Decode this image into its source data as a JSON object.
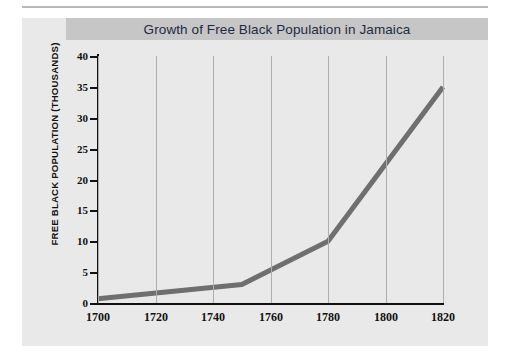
{
  "figure": {
    "title": "Growth of Free Black Population in Jamaica",
    "panel_bg": "#e9e9e9",
    "title_band_bg": "#c6c6c6",
    "title_color": "#1d2b44"
  },
  "chart_data": {
    "type": "line",
    "title": "Growth of Free Black Population in Jamaica",
    "xlabel": "",
    "ylabel": "FREE BLACK POPULATION (THOUSANDS)",
    "xlim": [
      1700,
      1820
    ],
    "ylim": [
      0,
      40
    ],
    "grid": "vertical",
    "legend": "none",
    "line_color": "#6f6f6f",
    "line_width_px": 5,
    "x_ticks": [
      1700,
      1720,
      1740,
      1760,
      1780,
      1800,
      1820
    ],
    "x_tick_labels": [
      "1700",
      "1720",
      "1740",
      "1760",
      "1780",
      "1800",
      "1820"
    ],
    "y_ticks": [
      0,
      5,
      10,
      15,
      20,
      25,
      30,
      35,
      40
    ],
    "y_tick_labels": [
      "0",
      "5",
      "10",
      "15",
      "20",
      "25",
      "30",
      "35",
      "40"
    ],
    "series": [
      {
        "name": "Free Black Population",
        "x": [
          1700,
          1750,
          1780,
          1820
        ],
        "values": [
          0.7,
          3.0,
          10.0,
          35.0
        ]
      }
    ]
  }
}
